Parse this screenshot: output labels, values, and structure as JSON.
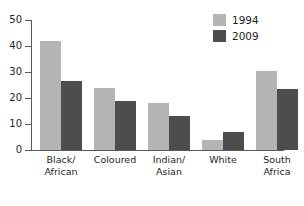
{
  "chart_data": {
    "type": "bar",
    "title": "",
    "xlabel": "",
    "ylabel": "",
    "ylim": [
      0,
      50
    ],
    "yticks": [
      0,
      10,
      20,
      30,
      40,
      50
    ],
    "ytick_labels": [
      "0",
      "10",
      "20",
      "30",
      "40",
      "50"
    ],
    "grid": false,
    "legend_position": "top-right",
    "categories": [
      "Black/\nAfrican",
      "Coloured",
      "Indian/\nAsian",
      "White",
      "South\nAfrica"
    ],
    "series": [
      {
        "name": "1994",
        "color": "#b4b4b4",
        "values": [
          42,
          24,
          18,
          4,
          30.5
        ]
      },
      {
        "name": "2009",
        "color": "#4d4d4d",
        "values": [
          26.5,
          19,
          13,
          7,
          23.5
        ]
      }
    ]
  },
  "legend": {
    "entries": [
      {
        "label": "1994",
        "color": "#b4b4b4"
      },
      {
        "label": "2009",
        "color": "#4d4d4d"
      }
    ]
  },
  "axis": {
    "line_color": "#58595b"
  }
}
